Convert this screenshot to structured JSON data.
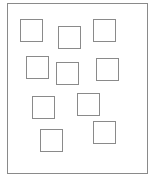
{
  "diagram": {
    "frame": {
      "x": 7,
      "y": 3,
      "width": 141,
      "height": 171,
      "stroke": "#8a8a8a"
    },
    "square_size": 23,
    "stroke_color": "#8a8a8a",
    "squares": [
      {
        "x": 20,
        "y": 19
      },
      {
        "x": 58,
        "y": 26
      },
      {
        "x": 93,
        "y": 19
      },
      {
        "x": 26,
        "y": 56
      },
      {
        "x": 56,
        "y": 62
      },
      {
        "x": 96,
        "y": 58
      },
      {
        "x": 32,
        "y": 96
      },
      {
        "x": 77,
        "y": 93
      },
      {
        "x": 40,
        "y": 129
      },
      {
        "x": 93,
        "y": 121
      }
    ]
  }
}
